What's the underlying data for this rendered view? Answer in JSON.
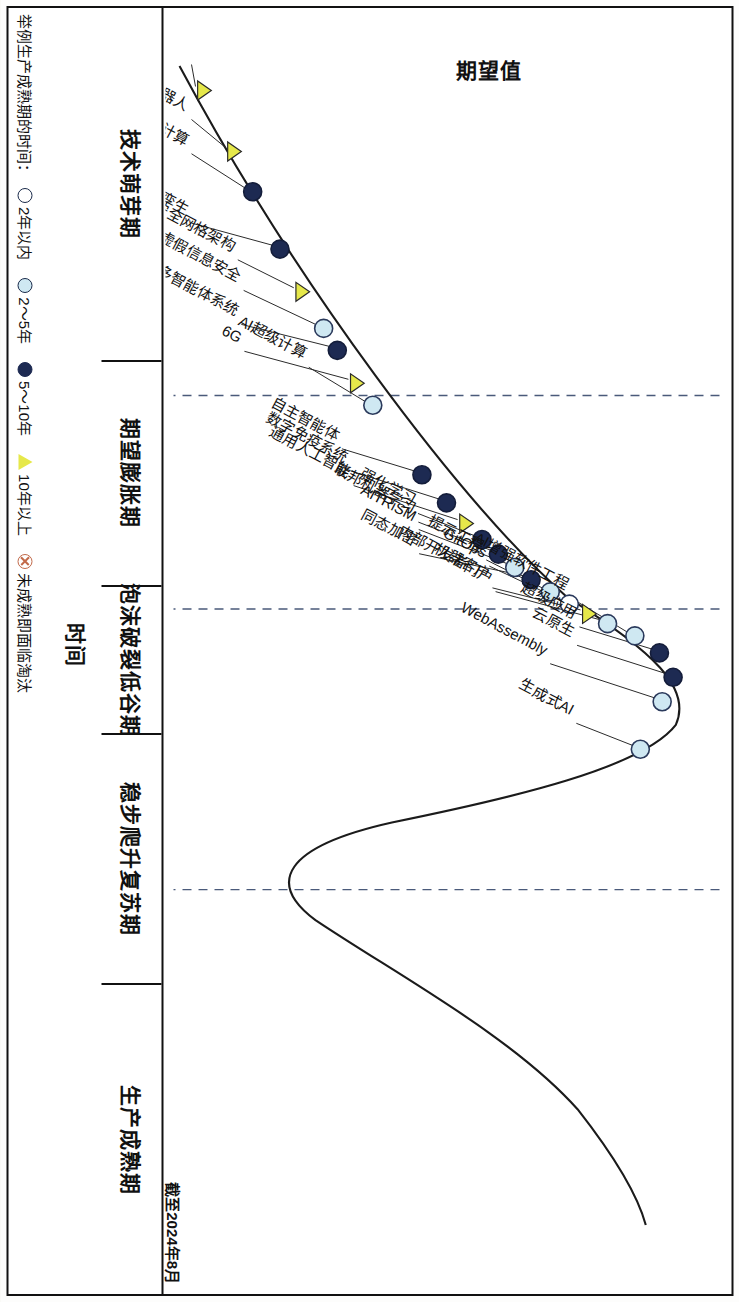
{
  "chart_data": {
    "type": "line",
    "title": "",
    "xlabel": "时间",
    "ylabel": "期望值",
    "asof_note": "截至2024年8月",
    "grid": true,
    "phase_boundaries_pct": [
      27.5,
      45.0,
      68.0
    ],
    "phases": [
      {
        "label": "技术萌芽期",
        "start_pct": 0,
        "end_pct": 27.5
      },
      {
        "label": "期望膨胀期",
        "start_pct": 27.5,
        "end_pct": 45.0
      },
      {
        "label": "泡沫破裂低谷期",
        "start_pct": 45.0,
        "end_pct": 56.5
      },
      {
        "label": "稳步爬升复苏期",
        "start_pct": 56.5,
        "end_pct": 76.0
      },
      {
        "label": "生产成熟期",
        "start_pct": 76.0,
        "end_pct": 100
      }
    ],
    "legend": {
      "title": "举例生产成熟期的时间：",
      "items": [
        {
          "marker": "circle-white",
          "label": "2年以内",
          "color": "#ffffff"
        },
        {
          "marker": "circle-lightblue",
          "label": "2～5年",
          "color": "#cfe8f2"
        },
        {
          "marker": "circle-darkblue",
          "label": "5～10年",
          "color": "#1d2a52"
        },
        {
          "marker": "triangle-yellow",
          "label": "10年以上",
          "color": "#e6e84a"
        },
        {
          "marker": "circle-cross",
          "label": "未成熟即面临淘汰",
          "color": "#c26a4a"
        }
      ]
    },
    "points": [
      {
        "label": "大行动模型",
        "x_pct": 2.5,
        "y_pct": 5.5,
        "marker": "triangle-yellow"
      },
      {
        "label": "人形工作机器人",
        "x_pct": 7.5,
        "y_pct": 11.0,
        "marker": "triangle-yellow"
      },
      {
        "label": "空间计算",
        "x_pct": 10.8,
        "y_pct": 14.5,
        "marker": "circle-darkblue"
      },
      {
        "label": "客户数字孪生",
        "x_pct": 15.5,
        "y_pct": 19.5,
        "marker": "circle-darkblue"
      },
      {
        "label": "网络安全网格架构",
        "x_pct": 19.0,
        "y_pct": 23.5,
        "marker": "triangle-yellow"
      },
      {
        "label": "虚假信息安全",
        "x_pct": 22.0,
        "y_pct": 27.5,
        "marker": "circle-lightblue"
      },
      {
        "label": "多智能体系统",
        "x_pct": 23.8,
        "y_pct": 30.0,
        "marker": "circle-darkblue"
      },
      {
        "label": "6G",
        "x_pct": 26.5,
        "y_pct": 33.5,
        "marker": "triangle-yellow"
      },
      {
        "label": "AI超级计算",
        "x_pct": 28.3,
        "y_pct": 36.5,
        "marker": "circle-lightblue"
      },
      {
        "label": "自主智能体",
        "x_pct": 34.0,
        "y_pct": 45.5,
        "marker": "circle-darkblue"
      },
      {
        "label": "数字免疫系统",
        "x_pct": 36.3,
        "y_pct": 50.0,
        "marker": "circle-darkblue"
      },
      {
        "label": "通用人工智能",
        "x_pct": 38.0,
        "y_pct": 53.5,
        "marker": "triangle-yellow"
      },
      {
        "label": "强化学习",
        "x_pct": 39.3,
        "y_pct": 56.5,
        "marker": "circle-darkblue"
      },
      {
        "label": "联邦机器学习",
        "x_pct": 40.5,
        "y_pct": 59.5,
        "marker": "circle-darkblue"
      },
      {
        "label": "AITRiSM",
        "x_pct": 41.6,
        "y_pct": 62.5,
        "marker": "circle-lightblue"
      },
      {
        "label": "同态加密",
        "x_pct": 42.6,
        "y_pct": 65.5,
        "marker": "circle-darkblue"
      },
      {
        "label": "提示工程",
        "x_pct": 43.6,
        "y_pct": 69.0,
        "marker": "circle-lightblue"
      },
      {
        "label": "GitOps",
        "x_pct": 44.6,
        "y_pct": 72.5,
        "marker": "circle-white"
      },
      {
        "label": "机器客户",
        "x_pct": 45.4,
        "y_pct": 76.0,
        "marker": "triangle-yellow"
      },
      {
        "label": "内部开发者门户",
        "x_pct": 46.2,
        "y_pct": 79.5,
        "marker": "circle-lightblue"
      },
      {
        "label": "AI增强软件工程",
        "x_pct": 47.2,
        "y_pct": 84.5,
        "marker": "circle-lightblue"
      },
      {
        "label": "超级应用",
        "x_pct": 48.6,
        "y_pct": 89.0,
        "marker": "circle-darkblue"
      },
      {
        "label": "云原生",
        "x_pct": 50.6,
        "y_pct": 91.5,
        "marker": "circle-darkblue"
      },
      {
        "label": "WebAssembly",
        "x_pct": 52.6,
        "y_pct": 89.5,
        "marker": "circle-lightblue"
      },
      {
        "label": "生成式AI",
        "x_pct": 56.5,
        "y_pct": 85.5,
        "marker": "circle-lightblue"
      }
    ]
  }
}
